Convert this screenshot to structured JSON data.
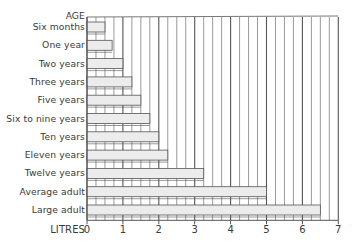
{
  "chart_data": {
    "type": "bar",
    "orientation": "horizontal",
    "title": "",
    "ylabel": "AGE",
    "xlabel": "LITRES",
    "categories": [
      "Six months",
      "One year",
      "Two years",
      "Three years",
      "Five years",
      "Six to nine years",
      "Ten years",
      "Eleven years",
      "Twelve years",
      "Average adult",
      "Large adult"
    ],
    "values": [
      0.5,
      0.7,
      1.0,
      1.25,
      1.5,
      1.75,
      2.0,
      2.25,
      3.25,
      5.0,
      6.5
    ],
    "xlim": [
      0,
      7
    ],
    "xticks": [
      "0",
      "1",
      "2",
      "3",
      "4",
      "5",
      "6",
      "7"
    ],
    "grid": "vertical lines every 0.25 litre, each bar region bounded by staircase frame",
    "legend": "none"
  },
  "labels": {
    "age": "AGE",
    "litres": "LITRES"
  },
  "colors": {
    "bar_fill": "#ececec",
    "line": "#555555",
    "text": "#3a3a3a"
  }
}
